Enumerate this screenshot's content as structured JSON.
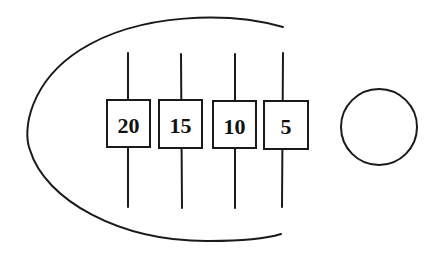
{
  "diagram": {
    "colors": {
      "stroke": "#1a1a1a",
      "background": "#ffffff"
    },
    "arc": {
      "shape": "open-ellipse-arc",
      "opening_side": "right"
    },
    "elements": [
      {
        "id": "element-1",
        "label": "20"
      },
      {
        "id": "element-2",
        "label": "15"
      },
      {
        "id": "element-3",
        "label": "10"
      },
      {
        "id": "element-4",
        "label": "5"
      }
    ],
    "circle": {
      "label": ""
    }
  }
}
